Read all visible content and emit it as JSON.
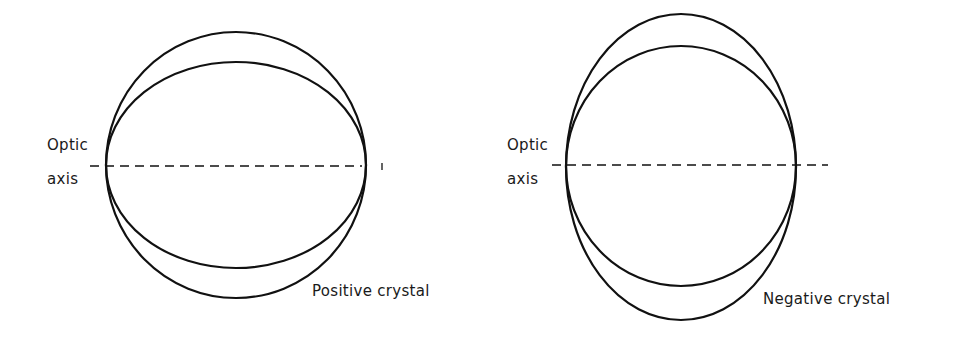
{
  "figures": [
    {
      "id": "positive",
      "caption": "Positive crystal",
      "axis_label_line1": "Optic",
      "axis_label_line2": "axis",
      "outer_shape": "circle",
      "inner_shape": "oblate ellipse",
      "geometry": {
        "center": [
          236,
          165
        ],
        "circle": {
          "rx": 130,
          "ry": 133
        },
        "ellipse": {
          "rx": 130,
          "ry": 103
        },
        "axis_line": {
          "x1": 90,
          "x2": 362,
          "y": 166
        }
      }
    },
    {
      "id": "negative",
      "caption": "Negative crystal",
      "axis_label_line1": "Optic",
      "axis_label_line2": "axis",
      "outer_shape": "prolate ellipse",
      "inner_shape": "circle",
      "geometry": {
        "center": [
          681,
          167
        ],
        "ellipse": {
          "rx": 115,
          "ry": 153
        },
        "circle": {
          "rx": 115,
          "ry": 120
        },
        "axis_line": {
          "x1": 553,
          "x2": 828,
          "y": 165
        }
      }
    }
  ],
  "colors": {
    "line": "#111111",
    "text": "#1a1a1a",
    "background": "#ffffff"
  }
}
